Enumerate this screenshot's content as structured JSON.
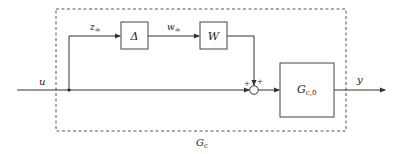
{
  "diagram": {
    "type": "block-diagram",
    "outer_block": {
      "label_main": "G",
      "label_sub": "c",
      "style": "dashed"
    },
    "blocks": [
      {
        "id": "delta",
        "label": "Δ"
      },
      {
        "id": "w",
        "label": "W"
      },
      {
        "id": "gc0",
        "label_main": "G",
        "label_sub": "c,0"
      }
    ],
    "signals": {
      "input": "u",
      "output": "y",
      "z": {
        "main": "z",
        "sub": "∞"
      },
      "w": {
        "main": "w",
        "sub": "∞"
      }
    },
    "summing_junction": {
      "signs": [
        "+",
        "+"
      ]
    },
    "colors": {
      "line": "#333333",
      "background": "#ffffff"
    }
  }
}
